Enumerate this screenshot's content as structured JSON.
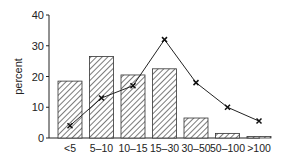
{
  "chart_data": {
    "type": "bar",
    "title": "",
    "xlabel": "",
    "ylabel": "percent",
    "ylim": [
      0,
      40
    ],
    "yticks": [
      0,
      10,
      20,
      30,
      40
    ],
    "grid": false,
    "categories": [
      "<5",
      "5–10",
      "10–15",
      "15–30",
      "30–50",
      "50–100",
      ">100"
    ],
    "series": [
      {
        "name": "bars",
        "type": "bar",
        "pattern": "hatched",
        "values": [
          18.5,
          26.5,
          20.5,
          22.5,
          6.5,
          1.5,
          0.5
        ]
      },
      {
        "name": "line",
        "type": "line",
        "marker": "x",
        "values": [
          4,
          13,
          17,
          32,
          18,
          10,
          5.5
        ]
      }
    ]
  }
}
